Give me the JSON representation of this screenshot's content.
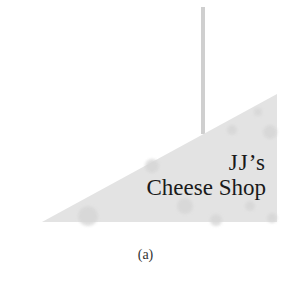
{
  "figure": {
    "sign": {
      "line1": "JJ’s",
      "line2": "Cheese Shop",
      "fill_color": "#e3e3e3",
      "spot_color": "#d8d8d8"
    },
    "rod": {
      "color": "#cfcfcf"
    },
    "caption": "(a)"
  }
}
